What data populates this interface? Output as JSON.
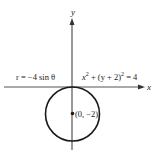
{
  "diagram": {
    "type": "polar-circle-graph",
    "axes": {
      "x_label": "x",
      "y_label": "y"
    },
    "equations": {
      "polar": "r = −4 sin θ",
      "cartesian_x": "x",
      "cartesian_exp1": "2",
      "cartesian_mid": " + (y + 2)",
      "cartesian_exp2": "2",
      "cartesian_rhs": " = 4"
    },
    "center_point": {
      "label": "(0, −2)"
    },
    "colors": {
      "axis": "#555555",
      "circle": "#1a1a1a",
      "text": "#1a1a1a"
    }
  }
}
